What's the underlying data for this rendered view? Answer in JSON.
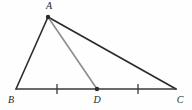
{
  "figure": {
    "type": "geometry-diagram",
    "background_color": "#fefefe",
    "width": 192,
    "height": 110,
    "points": [
      {
        "id": "A",
        "label": "A",
        "x": 48,
        "y": 17,
        "label_x": 49,
        "label_y": 7,
        "dot": true,
        "dot_radius": 2.2
      },
      {
        "id": "B",
        "label": "B",
        "x": 16,
        "y": 89,
        "label_x": 11,
        "label_y": 101,
        "dot": false,
        "dot_radius": 0
      },
      {
        "id": "D",
        "label": "D",
        "x": 97,
        "y": 89,
        "label_x": 97,
        "label_y": 101,
        "dot": true,
        "dot_radius": 2.2
      },
      {
        "id": "C",
        "label": "C",
        "x": 176,
        "y": 89,
        "label_x": 180,
        "label_y": 101,
        "dot": false,
        "dot_radius": 0
      }
    ],
    "segments": [
      {
        "id": "AB",
        "from": "A",
        "to": "B",
        "x1": 48,
        "y1": 17,
        "x2": 16,
        "y2": 89,
        "color": "#2b2b2b",
        "width": 1.6
      },
      {
        "id": "AC",
        "from": "A",
        "to": "C",
        "x1": 48,
        "y1": 17,
        "x2": 176,
        "y2": 89,
        "color": "#2b2b2b",
        "width": 1.7
      },
      {
        "id": "BC",
        "from": "B",
        "to": "C",
        "x1": 16,
        "y1": 89,
        "x2": 176,
        "y2": 89,
        "color": "#3a3a3a",
        "width": 1.5
      },
      {
        "id": "AD",
        "from": "A",
        "to": "D",
        "x1": 48,
        "y1": 17,
        "x2": 97,
        "y2": 89,
        "color": "#8c8c8c",
        "width": 1.6
      }
    ],
    "tick_marks": [
      {
        "id": "tick-BD",
        "on_segment": "BD",
        "x": 57,
        "y_top": 84,
        "y_bottom": 94,
        "color": "#3a3a3a",
        "width": 1.3
      },
      {
        "id": "tick-DC",
        "on_segment": "DC",
        "x": 138,
        "y_top": 84,
        "y_bottom": 94,
        "color": "#3a3a3a",
        "width": 1.3
      }
    ],
    "colors": {
      "stroke_dark": "#2b2b2b",
      "stroke_base": "#3a3a3a",
      "stroke_gray": "#8c8c8c",
      "label": "#262626",
      "background": "#fefefe"
    }
  }
}
